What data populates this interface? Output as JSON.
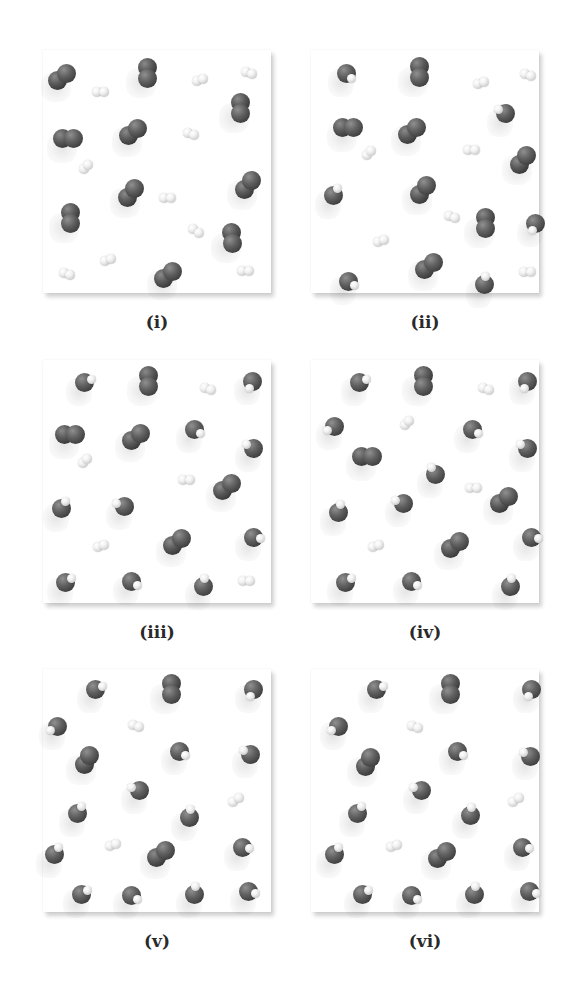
{
  "figure": {
    "legend_colors": {
      "heavy_atom": "#4a4a4a",
      "hydrogen": "#e8e8e8",
      "panel_background": "#ffffff"
    },
    "panels": [
      {
        "label": "(i)",
        "molecules": [
          {
            "type": "CO",
            "x": 19,
            "y": 27,
            "angle": -35
          },
          {
            "type": "CO",
            "x": 104,
            "y": 23,
            "angle": 90
          },
          {
            "type": "H2",
            "x": 157,
            "y": 30,
            "angle": -20
          },
          {
            "type": "H2",
            "x": 206,
            "y": 23,
            "angle": 20
          },
          {
            "type": "H2",
            "x": 57,
            "y": 42,
            "angle": 0
          },
          {
            "type": "CO",
            "x": 197,
            "y": 58,
            "angle": 90
          },
          {
            "type": "CO",
            "x": 25,
            "y": 88,
            "angle": 0
          },
          {
            "type": "CO",
            "x": 90,
            "y": 82,
            "angle": -35
          },
          {
            "type": "H2",
            "x": 148,
            "y": 84,
            "angle": 20
          },
          {
            "type": "H2",
            "x": 43,
            "y": 117,
            "angle": -45
          },
          {
            "type": "CO",
            "x": 205,
            "y": 135,
            "angle": -55
          },
          {
            "type": "CO",
            "x": 88,
            "y": 143,
            "angle": -50
          },
          {
            "type": "H2",
            "x": 124,
            "y": 148,
            "angle": 0
          },
          {
            "type": "CO",
            "x": 27,
            "y": 168,
            "angle": 90
          },
          {
            "type": "H2",
            "x": 153,
            "y": 181,
            "angle": 30
          },
          {
            "type": "CO",
            "x": 189,
            "y": 188,
            "angle": 80
          },
          {
            "type": "H2",
            "x": 65,
            "y": 210,
            "angle": -25
          },
          {
            "type": "CO",
            "x": 125,
            "y": 225,
            "angle": -35
          },
          {
            "type": "H2",
            "x": 24,
            "y": 224,
            "angle": 20
          },
          {
            "type": "H2",
            "x": 202,
            "y": 221,
            "angle": 0
          }
        ]
      },
      {
        "label": "(ii)",
        "molecules": [
          {
            "type": "H2O",
            "x": 35,
            "y": 23,
            "hdir": 45
          },
          {
            "type": "CO",
            "x": 108,
            "y": 22,
            "angle": 90
          },
          {
            "type": "H2",
            "x": 170,
            "y": 33,
            "angle": -20
          },
          {
            "type": "H2",
            "x": 217,
            "y": 25,
            "angle": 20
          },
          {
            "type": "H2O",
            "x": 194,
            "y": 63,
            "hdir": -150
          },
          {
            "type": "CO",
            "x": 37,
            "y": 77,
            "angle": 0
          },
          {
            "type": "CO",
            "x": 101,
            "y": 81,
            "angle": -40
          },
          {
            "type": "H2",
            "x": 58,
            "y": 103,
            "angle": -45
          },
          {
            "type": "H2",
            "x": 160,
            "y": 100,
            "angle": 0
          },
          {
            "type": "CO",
            "x": 212,
            "y": 110,
            "angle": -55
          },
          {
            "type": "H2O",
            "x": 22,
            "y": 145,
            "hdir": -60
          },
          {
            "type": "CO",
            "x": 112,
            "y": 140,
            "angle": -50
          },
          {
            "type": "H2",
            "x": 141,
            "y": 167,
            "angle": 20
          },
          {
            "type": "CO",
            "x": 174,
            "y": 173,
            "angle": 90
          },
          {
            "type": "H2O",
            "x": 224,
            "y": 173,
            "hdir": 110
          },
          {
            "type": "H2",
            "x": 70,
            "y": 191,
            "angle": -25
          },
          {
            "type": "H2O",
            "x": 37,
            "y": 231,
            "hdir": 30
          },
          {
            "type": "CO",
            "x": 118,
            "y": 216,
            "angle": -35
          },
          {
            "type": "H2O",
            "x": 173,
            "y": 234,
            "hdir": -80
          },
          {
            "type": "H2",
            "x": 216,
            "y": 222,
            "angle": 0
          }
        ]
      },
      {
        "label": "(iii)",
        "molecules": [
          {
            "type": "H2O",
            "x": 41,
            "y": 22,
            "hdir": -20
          },
          {
            "type": "CO",
            "x": 105,
            "y": 21,
            "angle": 90
          },
          {
            "type": "H2",
            "x": 165,
            "y": 29,
            "angle": 20
          },
          {
            "type": "H2O",
            "x": 209,
            "y": 21,
            "hdir": 110
          },
          {
            "type": "CO",
            "x": 27,
            "y": 74,
            "angle": 0
          },
          {
            "type": "CO",
            "x": 93,
            "y": 77,
            "angle": -35
          },
          {
            "type": "H2O",
            "x": 151,
            "y": 69,
            "hdir": 30
          },
          {
            "type": "H2O",
            "x": 210,
            "y": 88,
            "hdir": -150
          },
          {
            "type": "H2",
            "x": 42,
            "y": 101,
            "angle": -45
          },
          {
            "type": "H2",
            "x": 143,
            "y": 120,
            "angle": 0
          },
          {
            "type": "CO",
            "x": 184,
            "y": 127,
            "angle": -40
          },
          {
            "type": "H2O",
            "x": 18,
            "y": 148,
            "hdir": -60
          },
          {
            "type": "H2O",
            "x": 81,
            "y": 146,
            "hdir": -160
          },
          {
            "type": "H2",
            "x": 58,
            "y": 186,
            "angle": -20
          },
          {
            "type": "CO",
            "x": 134,
            "y": 182,
            "angle": -40
          },
          {
            "type": "H2O",
            "x": 210,
            "y": 177,
            "hdir": 10
          },
          {
            "type": "H2O",
            "x": 22,
            "y": 222,
            "hdir": -30
          },
          {
            "type": "H2O",
            "x": 88,
            "y": 221,
            "hdir": 30
          },
          {
            "type": "H2O",
            "x": 160,
            "y": 226,
            "hdir": -80
          },
          {
            "type": "H2",
            "x": 203,
            "y": 221,
            "angle": 0
          }
        ]
      },
      {
        "label": "(iv)",
        "molecules": [
          {
            "type": "H2O",
            "x": 48,
            "y": 22,
            "hdir": -20
          },
          {
            "type": "CO",
            "x": 112,
            "y": 21,
            "angle": 90
          },
          {
            "type": "H2",
            "x": 175,
            "y": 29,
            "angle": 20
          },
          {
            "type": "H2O",
            "x": 216,
            "y": 21,
            "hdir": 110
          },
          {
            "type": "H2O",
            "x": 23,
            "y": 66,
            "hdir": 150
          },
          {
            "type": "H2",
            "x": 96,
            "y": 63,
            "angle": -45
          },
          {
            "type": "H2O",
            "x": 161,
            "y": 69,
            "hdir": 30
          },
          {
            "type": "H2O",
            "x": 216,
            "y": 88,
            "hdir": -150
          },
          {
            "type": "CO",
            "x": 56,
            "y": 96,
            "angle": 0
          },
          {
            "type": "H2O",
            "x": 124,
            "y": 114,
            "hdir": -120
          },
          {
            "type": "H2",
            "x": 162,
            "y": 128,
            "angle": 0
          },
          {
            "type": "CO",
            "x": 193,
            "y": 140,
            "angle": -40
          },
          {
            "type": "H2O",
            "x": 27,
            "y": 152,
            "hdir": -70
          },
          {
            "type": "H2O",
            "x": 92,
            "y": 143,
            "hdir": -160
          },
          {
            "type": "H2",
            "x": 65,
            "y": 186,
            "angle": -20
          },
          {
            "type": "CO",
            "x": 144,
            "y": 185,
            "angle": -40
          },
          {
            "type": "H2O",
            "x": 220,
            "y": 177,
            "hdir": 10
          },
          {
            "type": "H2O",
            "x": 34,
            "y": 222,
            "hdir": -30
          },
          {
            "type": "H2O",
            "x": 100,
            "y": 221,
            "hdir": 30
          },
          {
            "type": "H2O",
            "x": 199,
            "y": 226,
            "hdir": -80
          }
        ]
      },
      {
        "label": "(v)",
        "molecules": [
          {
            "type": "H2O",
            "x": 52,
            "y": 20,
            "hdir": -20
          },
          {
            "type": "CO",
            "x": 128,
            "y": 20,
            "angle": 90
          },
          {
            "type": "H2O",
            "x": 210,
            "y": 20,
            "hdir": 110
          },
          {
            "type": "H2O",
            "x": 14,
            "y": 57,
            "hdir": 150
          },
          {
            "type": "H2",
            "x": 93,
            "y": 57,
            "angle": 20
          },
          {
            "type": "H2O",
            "x": 136,
            "y": 82,
            "hdir": 30
          },
          {
            "type": "H2O",
            "x": 207,
            "y": 85,
            "hdir": -150
          },
          {
            "type": "CO",
            "x": 44,
            "y": 91,
            "angle": -60
          },
          {
            "type": "H2O",
            "x": 96,
            "y": 121,
            "hdir": -160
          },
          {
            "type": "H2",
            "x": 193,
            "y": 131,
            "angle": -40
          },
          {
            "type": "H2O",
            "x": 34,
            "y": 144,
            "hdir": -60
          },
          {
            "type": "H2O",
            "x": 146,
            "y": 148,
            "hdir": -80
          },
          {
            "type": "H2O",
            "x": 11,
            "y": 185,
            "hdir": -60
          },
          {
            "type": "H2",
            "x": 70,
            "y": 176,
            "angle": -20
          },
          {
            "type": "CO",
            "x": 118,
            "y": 185,
            "angle": -40
          },
          {
            "type": "H2O",
            "x": 199,
            "y": 178,
            "hdir": 10
          },
          {
            "type": "H2O",
            "x": 38,
            "y": 225,
            "hdir": -30
          },
          {
            "type": "H2O",
            "x": 88,
            "y": 226,
            "hdir": 30
          },
          {
            "type": "H2O",
            "x": 151,
            "y": 225,
            "hdir": -80
          },
          {
            "type": "H2O",
            "x": 205,
            "y": 222,
            "hdir": 20
          }
        ]
      },
      {
        "label": "(vi)",
        "molecules": [
          {
            "type": "H2O",
            "x": 65,
            "y": 20,
            "hdir": -20
          },
          {
            "type": "CO",
            "x": 139,
            "y": 20,
            "angle": 90
          },
          {
            "type": "H2O",
            "x": 220,
            "y": 20,
            "hdir": 110
          },
          {
            "type": "H2O",
            "x": 27,
            "y": 57,
            "hdir": 150
          },
          {
            "type": "H2",
            "x": 104,
            "y": 58,
            "angle": 20
          },
          {
            "type": "H2O",
            "x": 146,
            "y": 82,
            "hdir": 30
          },
          {
            "type": "H2O",
            "x": 219,
            "y": 87,
            "hdir": -150
          },
          {
            "type": "CO",
            "x": 57,
            "y": 93,
            "angle": -60
          },
          {
            "type": "H2O",
            "x": 110,
            "y": 121,
            "hdir": -160
          },
          {
            "type": "H2",
            "x": 205,
            "y": 131,
            "angle": -40
          },
          {
            "type": "H2O",
            "x": 46,
            "y": 144,
            "hdir": -60
          },
          {
            "type": "H2O",
            "x": 159,
            "y": 146,
            "hdir": -80
          },
          {
            "type": "H2O",
            "x": 23,
            "y": 185,
            "hdir": -60
          },
          {
            "type": "H2",
            "x": 83,
            "y": 177,
            "angle": -20
          },
          {
            "type": "CO",
            "x": 131,
            "y": 186,
            "angle": -40
          },
          {
            "type": "H2O",
            "x": 211,
            "y": 178,
            "hdir": 10
          },
          {
            "type": "H2O",
            "x": 51,
            "y": 225,
            "hdir": -30
          },
          {
            "type": "H2O",
            "x": 100,
            "y": 226,
            "hdir": 30
          },
          {
            "type": "H2O",
            "x": 163,
            "y": 225,
            "hdir": -80
          },
          {
            "type": "H2O",
            "x": 218,
            "y": 222,
            "hdir": 20
          }
        ]
      }
    ],
    "layout": {
      "panel_positions": [
        {
          "left": 43,
          "top": 50
        },
        {
          "left": 311,
          "top": 50
        },
        {
          "left": 43,
          "top": 360
        },
        {
          "left": 311,
          "top": 360
        },
        {
          "left": 43,
          "top": 669
        },
        {
          "left": 311,
          "top": 669
        }
      ],
      "label_offset": 262
    }
  }
}
